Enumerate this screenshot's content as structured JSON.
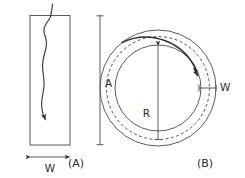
{
  "figure": {
    "background_color": "#ffffff",
    "line_color": "#4a4a4a",
    "crack_color": "#2e2e2e",
    "panels": [
      {
        "id": "A",
        "caption": "(A)",
        "shape": "rectangle",
        "description": "Rectangular strip with a through-thickness wavy crack",
        "dimensions": [
          {
            "name": "A",
            "label": "A",
            "orientation": "vertical",
            "position": "right"
          },
          {
            "name": "W",
            "label": "W",
            "orientation": "horizontal",
            "position": "bottom"
          }
        ],
        "crack": {
          "style": "wavy-line",
          "tip_marker": "arrow",
          "direction": "top-to-bottom"
        }
      },
      {
        "id": "B",
        "caption": "(B)",
        "shape": "annulus",
        "description": "Annular ring with a circumferential crack following the dashed mid-line",
        "dimensions": [
          {
            "name": "R",
            "label": "R",
            "orientation": "vertical",
            "position": "center"
          },
          {
            "name": "W",
            "label": "W",
            "orientation": "horizontal",
            "position": "right"
          }
        ],
        "circles": [
          {
            "name": "outer-circle",
            "style": "solid"
          },
          {
            "name": "mid-circle",
            "style": "dashed"
          },
          {
            "name": "inner-circle",
            "style": "solid"
          }
        ],
        "crack": {
          "style": "arc",
          "tip_marker": "arrow",
          "direction": "counterclockwise-to-clockwise"
        }
      }
    ]
  },
  "labels": {
    "panel_a_caption": "(A)",
    "panel_b_caption": "(B)",
    "dim_a": "A",
    "dim_w_left": "W",
    "dim_r": "R",
    "dim_w_right": "W"
  }
}
